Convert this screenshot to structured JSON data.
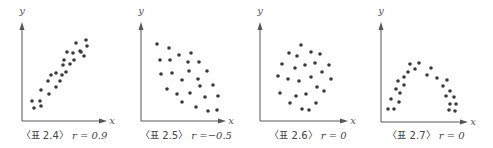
{
  "chart_data": [
    {
      "type": "scatter",
      "title": "〈표 2.4〉",
      "caption_label": "〈표 2.4〉",
      "caption_r": "r = 0.9",
      "xlabel": "x",
      "ylabel": "y",
      "correlation": 0.9,
      "axes": {
        "ox": 22,
        "oy": 121,
        "xend": 107,
        "ytop": 22,
        "xlabel_x": 112,
        "ylabel_x": 22,
        "ylabel_y": 14,
        "caption_x": 64
      },
      "points": [
        [
          32,
          101
        ],
        [
          34,
          108
        ],
        [
          40,
          101
        ],
        [
          41,
          106
        ],
        [
          41,
          90
        ],
        [
          49,
          94
        ],
        [
          48,
          81
        ],
        [
          51,
          75
        ],
        [
          56,
          87
        ],
        [
          56,
          73
        ],
        [
          60,
          81
        ],
        [
          62,
          75
        ],
        [
          66,
          72
        ],
        [
          63,
          65
        ],
        [
          64,
          60
        ],
        [
          70,
          64
        ],
        [
          67,
          52
        ],
        [
          73,
          53
        ],
        [
          74,
          60
        ],
        [
          76,
          43
        ],
        [
          80,
          51
        ],
        [
          81,
          52
        ],
        [
          84,
          56
        ],
        [
          86,
          40
        ],
        [
          87,
          46
        ]
      ]
    },
    {
      "type": "scatter",
      "title": "〈표 2.5〉",
      "caption_label": "〈표 2.5〉",
      "caption_r": "r =−0.5",
      "xlabel": "x",
      "ylabel": "y",
      "correlation": -0.5,
      "axes": {
        "ox": 141,
        "oy": 121,
        "xend": 226,
        "ytop": 22,
        "xlabel_x": 231,
        "ylabel_x": 141,
        "ylabel_y": 14,
        "caption_x": 186
      },
      "points": [
        [
          157,
          44
        ],
        [
          169,
          48
        ],
        [
          160,
          60
        ],
        [
          170,
          60
        ],
        [
          179,
          55
        ],
        [
          191,
          53
        ],
        [
          188,
          62
        ],
        [
          199,
          62
        ],
        [
          161,
          74
        ],
        [
          172,
          73
        ],
        [
          189,
          71
        ],
        [
          207,
          71
        ],
        [
          182,
          80
        ],
        [
          198,
          79
        ],
        [
          200,
          86
        ],
        [
          213,
          85
        ],
        [
          167,
          89
        ],
        [
          177,
          94
        ],
        [
          190,
          93
        ],
        [
          205,
          97
        ],
        [
          218,
          96
        ],
        [
          182,
          102
        ],
        [
          196,
          107
        ],
        [
          208,
          111
        ],
        [
          217,
          110
        ]
      ]
    },
    {
      "type": "scatter",
      "title": "〈표 2.6〉",
      "caption_label": "〈표 2.6〉",
      "caption_r": "r = 0",
      "xlabel": "x",
      "ylabel": "y",
      "correlation": 0,
      "axes": {
        "ox": 260,
        "oy": 121,
        "xend": 348,
        "ytop": 22,
        "xlabel_x": 353,
        "ylabel_x": 260,
        "ylabel_y": 14,
        "caption_x": 308
      },
      "points": [
        [
          301,
          45
        ],
        [
          289,
          53
        ],
        [
          297,
          56
        ],
        [
          311,
          52
        ],
        [
          320,
          54
        ],
        [
          282,
          64
        ],
        [
          295,
          68
        ],
        [
          305,
          65
        ],
        [
          315,
          63
        ],
        [
          329,
          65
        ],
        [
          278,
          76
        ],
        [
          288,
          79
        ],
        [
          299,
          81
        ],
        [
          311,
          77
        ],
        [
          322,
          72
        ],
        [
          331,
          79
        ],
        [
          317,
          87
        ],
        [
          324,
          91
        ],
        [
          280,
          93
        ],
        [
          296,
          96
        ],
        [
          306,
          94
        ],
        [
          290,
          103
        ],
        [
          316,
          103
        ],
        [
          302,
          109
        ],
        [
          309,
          110
        ]
      ]
    },
    {
      "type": "scatter",
      "title": "〈표 2.7〉",
      "caption_label": "〈표 2.7〉",
      "caption_r": "r = 0",
      "xlabel": "x",
      "ylabel": "y",
      "correlation": 0,
      "axes": {
        "ox": 381,
        "oy": 122,
        "xend": 468,
        "ytop": 22,
        "xlabel_x": 473,
        "ylabel_x": 381,
        "ylabel_y": 14,
        "caption_x": 426
      },
      "points": [
        [
          388,
          109
        ],
        [
          394,
          109
        ],
        [
          391,
          99
        ],
        [
          399,
          102
        ],
        [
          396,
          89
        ],
        [
          400,
          93
        ],
        [
          398,
          81
        ],
        [
          404,
          85
        ],
        [
          404,
          77
        ],
        [
          408,
          72
        ],
        [
          410,
          64
        ],
        [
          415,
          69
        ],
        [
          419,
          63
        ],
        [
          427,
          75
        ],
        [
          431,
          68
        ],
        [
          437,
          78
        ],
        [
          443,
          86
        ],
        [
          447,
          80
        ],
        [
          450,
          91
        ],
        [
          446,
          96
        ],
        [
          454,
          97
        ],
        [
          450,
          104
        ],
        [
          456,
          104
        ],
        [
          449,
          110
        ],
        [
          455,
          111
        ]
      ]
    }
  ],
  "style": {
    "point_color": "#3a3a3a",
    "axis_color": "#555555",
    "caption_color": "#444444"
  }
}
